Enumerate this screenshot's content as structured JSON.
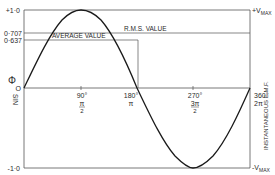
{
  "diagram": {
    "title": "",
    "y_axis_left": {
      "label": "SIN Φ",
      "symbol": "Φ",
      "label_sin": "SIN",
      "ticks": [
        {
          "label": "+1·0",
          "value": 1.0
        },
        {
          "label": "0·707",
          "value": 0.707
        },
        {
          "label": "0·637",
          "value": 0.637
        },
        {
          "label": "O",
          "value": 0
        },
        {
          "label": "-1·0",
          "value": -1.0
        }
      ]
    },
    "y_axis_right": {
      "label": "INSTANTANEOUS  E.M.F.",
      "top": "+V",
      "top_sub": "MAX",
      "bottom": "-V",
      "bottom_sub": "MAX"
    },
    "x_axis": {
      "ticks": [
        {
          "deg": "90°",
          "rad_num": "π",
          "rad_den": "2"
        },
        {
          "deg": "180°",
          "rad": "π"
        },
        {
          "deg": "270°",
          "rad_num": "3π",
          "rad_den": "2"
        },
        {
          "deg": "360°",
          "rad": "2π"
        }
      ]
    },
    "annotations": {
      "rms": "R.M.S.  VALUE",
      "average": "AVERAGE VALUE"
    },
    "colors": {
      "line": "#1a1a1a",
      "grid": "#555555",
      "background": "#ffffff"
    }
  }
}
